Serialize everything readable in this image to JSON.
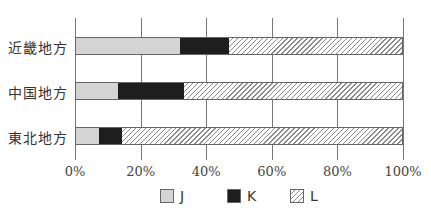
{
  "chart_data": {
    "type": "bar",
    "orientation": "horizontal",
    "stacked": true,
    "percent_stacked": true,
    "title": "",
    "xlabel": "",
    "ylabel": "",
    "xlim": [
      0,
      100
    ],
    "categories": [
      "近畿地方",
      "中国地方",
      "東北地方"
    ],
    "series": [
      {
        "name": "J",
        "values": [
          32,
          13,
          7
        ],
        "color": "#d4d4d4",
        "pattern": "solid-light-gray"
      },
      {
        "name": "K",
        "values": [
          15,
          20,
          7
        ],
        "color": "#1e1e1e",
        "pattern": "solid-black"
      },
      {
        "name": "L",
        "values": [
          53,
          67,
          86
        ],
        "color": "#ffffff",
        "pattern": "diagonal-hatch"
      }
    ],
    "x_ticks": [
      "0%",
      "20%",
      "40%",
      "60%",
      "80%",
      "100%"
    ],
    "grid": "vertical",
    "legend_position": "bottom"
  },
  "legend": {
    "items": [
      {
        "label": "J"
      },
      {
        "label": "K"
      },
      {
        "label": "L"
      }
    ]
  }
}
